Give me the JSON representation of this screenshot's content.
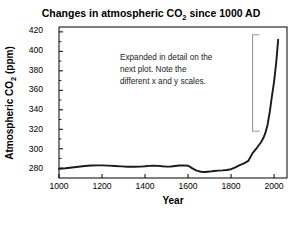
{
  "chart_data": {
    "type": "line",
    "title": "Changes in atmospheric CO2 since 1000 AD",
    "title_parts": {
      "before": "Changes in atmospheric CO",
      "subscript": "2",
      "after": " since 1000 AD"
    },
    "xlabel": "Year",
    "ylabel": "Atmospheric CO2 (ppm)",
    "ylabel_parts": {
      "before": "Atmospheric CO",
      "subscript": "2",
      "after": " (ppm)"
    },
    "xlim": [
      1000,
      2060
    ],
    "ylim": [
      270,
      425
    ],
    "xticks": [
      1000,
      1200,
      1400,
      1600,
      1800,
      2000
    ],
    "xtick_labels": [
      "1000",
      "1200",
      "1400",
      "1600",
      "1800",
      "2000"
    ],
    "yticks": [
      280,
      300,
      320,
      340,
      360,
      380,
      400,
      420
    ],
    "ytick_labels": [
      "280",
      "300",
      "320",
      "340",
      "360",
      "380",
      "400",
      "420"
    ],
    "y_minor_step": 10,
    "grid": false,
    "legend": false,
    "series": [
      {
        "name": "Atmospheric CO2",
        "color": "#1a1a1a",
        "x": [
          1000,
          1030,
          1060,
          1090,
          1120,
          1150,
          1180,
          1200,
          1230,
          1260,
          1290,
          1320,
          1350,
          1380,
          1400,
          1420,
          1440,
          1460,
          1480,
          1500,
          1520,
          1540,
          1560,
          1580,
          1600,
          1610,
          1620,
          1640,
          1660,
          1680,
          1700,
          1720,
          1740,
          1760,
          1780,
          1800,
          1820,
          1840,
          1860,
          1880,
          1900,
          1920,
          1940,
          1950,
          1960,
          1970,
          1980,
          1990,
          2000,
          2010,
          2019
        ],
        "y": [
          279.5,
          280.0,
          280.8,
          281.6,
          282.3,
          282.8,
          283.0,
          283.0,
          282.7,
          282.3,
          281.9,
          281.6,
          281.5,
          281.7,
          282.0,
          282.4,
          282.6,
          282.4,
          282.0,
          281.7,
          281.8,
          282.3,
          282.8,
          283.0,
          282.6,
          281.4,
          279.8,
          277.5,
          276.4,
          276.2,
          276.6,
          277.2,
          277.6,
          277.8,
          278.2,
          279.0,
          281.0,
          283.2,
          285.0,
          287.5,
          295.5,
          301.0,
          307.0,
          311.0,
          316.5,
          325.0,
          338.0,
          354.0,
          369.0,
          389.0,
          412.0
        ]
      }
    ],
    "annotation": {
      "lines": [
        "Expanded in detail on the",
        "next plot. Note the",
        "different x and y scales."
      ]
    },
    "bracket": {
      "label": "detail-region-bracket",
      "color": "#9a9a9a",
      "x_year": 1900,
      "y_top": 417,
      "y_bottom": 318
    }
  }
}
